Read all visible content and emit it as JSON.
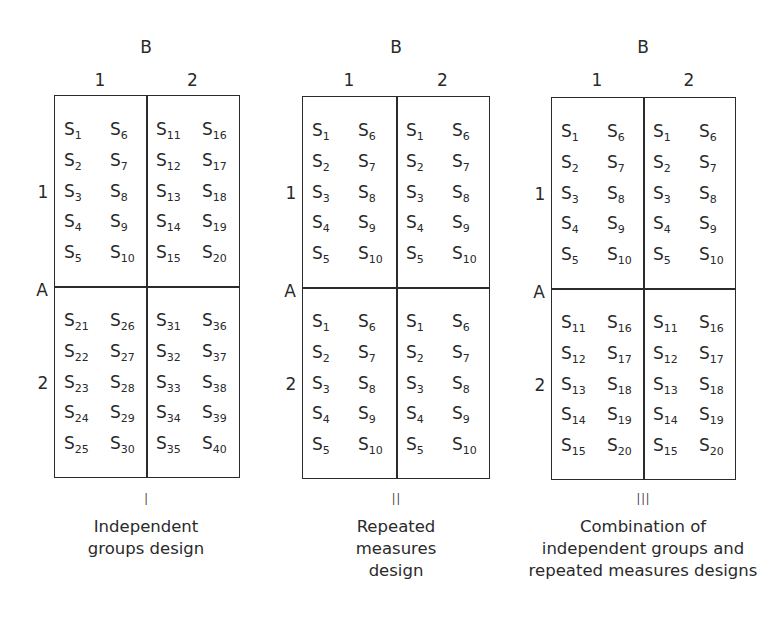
{
  "factor_labels": {
    "column_factor": "B",
    "row_factor": "A",
    "levels": [
      "1",
      "2"
    ]
  },
  "panels": [
    {
      "numeral": "I",
      "caption": [
        "Independent",
        "groups design"
      ],
      "cells": {
        "a1b1": [
          [
            "S",
            "1"
          ],
          [
            "S",
            "6"
          ],
          [
            "S",
            "2"
          ],
          [
            "S",
            "7"
          ],
          [
            "S",
            "3"
          ],
          [
            "S",
            "8"
          ],
          [
            "S",
            "4"
          ],
          [
            "S",
            "9"
          ],
          [
            "S",
            "5"
          ],
          [
            "S",
            "10"
          ]
        ],
        "a1b2": [
          [
            "S",
            "11"
          ],
          [
            "S",
            "16"
          ],
          [
            "S",
            "12"
          ],
          [
            "S",
            "17"
          ],
          [
            "S",
            "13"
          ],
          [
            "S",
            "18"
          ],
          [
            "S",
            "14"
          ],
          [
            "S",
            "19"
          ],
          [
            "S",
            "15"
          ],
          [
            "S",
            "20"
          ]
        ],
        "a2b1": [
          [
            "S",
            "21"
          ],
          [
            "S",
            "26"
          ],
          [
            "S",
            "22"
          ],
          [
            "S",
            "27"
          ],
          [
            "S",
            "23"
          ],
          [
            "S",
            "28"
          ],
          [
            "S",
            "24"
          ],
          [
            "S",
            "29"
          ],
          [
            "S",
            "25"
          ],
          [
            "S",
            "30"
          ]
        ],
        "a2b2": [
          [
            "S",
            "31"
          ],
          [
            "S",
            "36"
          ],
          [
            "S",
            "32"
          ],
          [
            "S",
            "37"
          ],
          [
            "S",
            "33"
          ],
          [
            "S",
            "38"
          ],
          [
            "S",
            "34"
          ],
          [
            "S",
            "39"
          ],
          [
            "S",
            "35"
          ],
          [
            "S",
            "40"
          ]
        ]
      }
    },
    {
      "numeral": "II",
      "caption": [
        "Repeated",
        "measures",
        "design"
      ],
      "cells": {
        "a1b1": [
          [
            "S",
            "1"
          ],
          [
            "S",
            "6"
          ],
          [
            "S",
            "2"
          ],
          [
            "S",
            "7"
          ],
          [
            "S",
            "3"
          ],
          [
            "S",
            "8"
          ],
          [
            "S",
            "4"
          ],
          [
            "S",
            "9"
          ],
          [
            "S",
            "5"
          ],
          [
            "S",
            "10"
          ]
        ],
        "a1b2": [
          [
            "S",
            "1"
          ],
          [
            "S",
            "6"
          ],
          [
            "S",
            "2"
          ],
          [
            "S",
            "7"
          ],
          [
            "S",
            "3"
          ],
          [
            "S",
            "8"
          ],
          [
            "S",
            "4"
          ],
          [
            "S",
            "9"
          ],
          [
            "S",
            "5"
          ],
          [
            "S",
            "10"
          ]
        ],
        "a2b1": [
          [
            "S",
            "1"
          ],
          [
            "S",
            "6"
          ],
          [
            "S",
            "2"
          ],
          [
            "S",
            "7"
          ],
          [
            "S",
            "3"
          ],
          [
            "S",
            "8"
          ],
          [
            "S",
            "4"
          ],
          [
            "S",
            "9"
          ],
          [
            "S",
            "5"
          ],
          [
            "S",
            "10"
          ]
        ],
        "a2b2": [
          [
            "S",
            "1"
          ],
          [
            "S",
            "6"
          ],
          [
            "S",
            "2"
          ],
          [
            "S",
            "7"
          ],
          [
            "S",
            "3"
          ],
          [
            "S",
            "8"
          ],
          [
            "S",
            "4"
          ],
          [
            "S",
            "9"
          ],
          [
            "S",
            "5"
          ],
          [
            "S",
            "10"
          ]
        ]
      }
    },
    {
      "numeral": "III",
      "caption": [
        "Combination of",
        "independent groups and",
        "repeated measures designs"
      ],
      "cells": {
        "a1b1": [
          [
            "S",
            "1"
          ],
          [
            "S",
            "6"
          ],
          [
            "S",
            "2"
          ],
          [
            "S",
            "7"
          ],
          [
            "S",
            "3"
          ],
          [
            "S",
            "8"
          ],
          [
            "S",
            "4"
          ],
          [
            "S",
            "9"
          ],
          [
            "S",
            "5"
          ],
          [
            "S",
            "10"
          ]
        ],
        "a1b2": [
          [
            "S",
            "1"
          ],
          [
            "S",
            "6"
          ],
          [
            "S",
            "2"
          ],
          [
            "S",
            "7"
          ],
          [
            "S",
            "3"
          ],
          [
            "S",
            "8"
          ],
          [
            "S",
            "4"
          ],
          [
            "S",
            "9"
          ],
          [
            "S",
            "5"
          ],
          [
            "S",
            "10"
          ]
        ],
        "a2b1": [
          [
            "S",
            "11"
          ],
          [
            "S",
            "16"
          ],
          [
            "S",
            "12"
          ],
          [
            "S",
            "17"
          ],
          [
            "S",
            "13"
          ],
          [
            "S",
            "18"
          ],
          [
            "S",
            "14"
          ],
          [
            "S",
            "19"
          ],
          [
            "S",
            "15"
          ],
          [
            "S",
            "20"
          ]
        ],
        "a2b2": [
          [
            "S",
            "11"
          ],
          [
            "S",
            "16"
          ],
          [
            "S",
            "12"
          ],
          [
            "S",
            "17"
          ],
          [
            "S",
            "13"
          ],
          [
            "S",
            "18"
          ],
          [
            "S",
            "14"
          ],
          [
            "S",
            "19"
          ],
          [
            "S",
            "15"
          ],
          [
            "S",
            "20"
          ]
        ]
      }
    }
  ]
}
